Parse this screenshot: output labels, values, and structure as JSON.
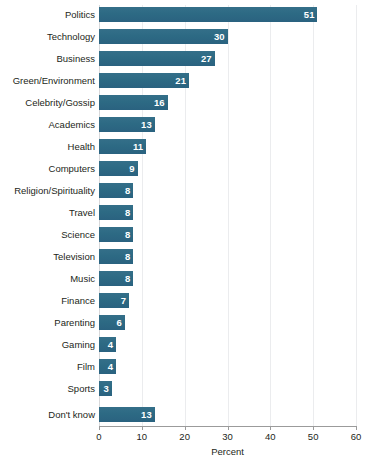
{
  "chart_data": {
    "type": "bar",
    "orientation": "horizontal",
    "title": "",
    "xlabel": "Percent",
    "ylabel": "",
    "xlim": [
      0,
      60
    ],
    "xticks": [
      0,
      10,
      20,
      30,
      40,
      50,
      60
    ],
    "xtick_labels": [
      "0",
      "10",
      "20",
      "30",
      "40",
      "50",
      "60"
    ],
    "grid": true,
    "grid_axis": "x",
    "legend": false,
    "bar_color": "#2d6a84",
    "value_label_color": "#ffffff",
    "categories": [
      "Politics",
      "Technology",
      "Business",
      "Green/Environment",
      "Celebrity/Gossip",
      "Academics",
      "Health",
      "Computers",
      "Religion/Spirituality",
      "Travel",
      "Science",
      "Television",
      "Music",
      "Finance",
      "Parenting",
      "Gaming",
      "Film",
      "Sports",
      "Don't know"
    ],
    "values": [
      51,
      30,
      27,
      21,
      16,
      13,
      11,
      9,
      8,
      8,
      8,
      8,
      8,
      7,
      6,
      4,
      4,
      3,
      13
    ],
    "value_labels": [
      "51",
      "30",
      "27",
      "21",
      "16",
      "13",
      "11",
      "9",
      "8",
      "8",
      "8",
      "8",
      "8",
      "7",
      "6",
      "4",
      "4",
      "3",
      "13"
    ],
    "separated_last_category": true
  }
}
